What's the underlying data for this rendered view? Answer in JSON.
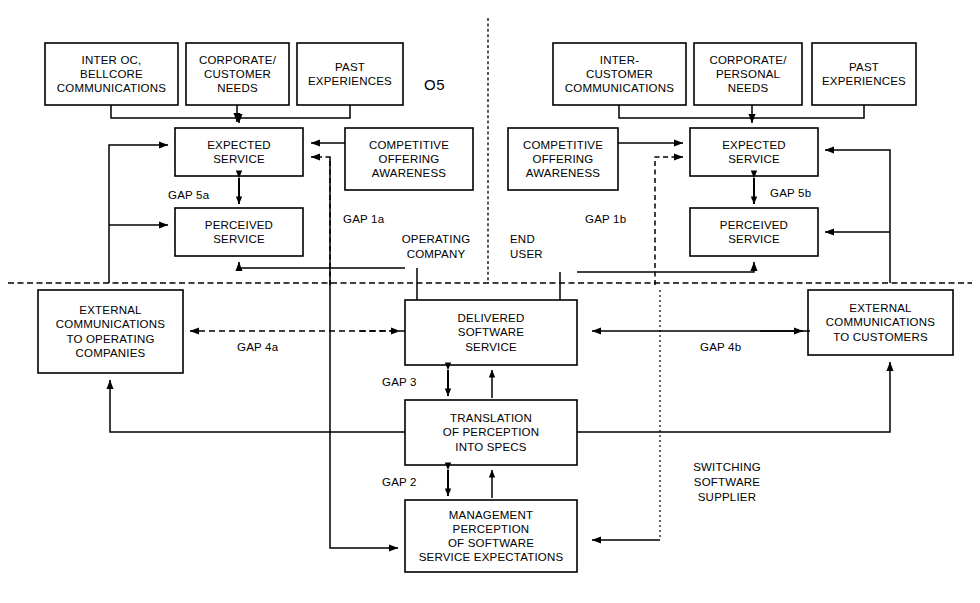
{
  "figure": {
    "number": "O5",
    "zones": {
      "left": "OPERATING\nCOMPANY",
      "right": "END\nUSER",
      "supplier": "SWITCHING\nSOFTWARE\nSUPPLIER"
    }
  },
  "boxes": {
    "inter_oc": "INTER OC,\nBELLCORE\nCOMMUNICATIONS",
    "corporate_customer_needs": "CORPORATE/\nCUSTOMER\nNEEDS",
    "past_experiences_left": "PAST\nEXPERIENCES",
    "expected_service_left": "EXPECTED\nSERVICE",
    "perceived_service_left": "PERCEIVED\nSERVICE",
    "competitive_offering_left": "COMPETITIVE\nOFFERING\nAWARENESS",
    "external_comms_oc": "EXTERNAL\nCOMMUNICATIONS\nTO OPERATING\nCOMPANIES",
    "inter_customer": "INTER-\nCUSTOMER\nCOMMUNICATIONS",
    "corporate_personal_needs": "CORPORATE/\nPERSONAL\nNEEDS",
    "past_experiences_right": "PAST\nEXPERIENCES",
    "expected_service_right": "EXPECTED\nSERVICE",
    "perceived_service_right": "PERCEIVED\nSERVICE",
    "competitive_offering_right": "COMPETITIVE\nOFFERING\nAWARENESS",
    "external_comms_customers": "EXTERNAL\nCOMMUNICATIONS\nTO CUSTOMERS",
    "delivered_software_service": "DELIVERED\nSOFTWARE\nSERVICE",
    "translation_of_perception": "TRANSLATION\nOF PERCEPTION\nINTO SPECS",
    "management_perception": "MANAGEMENT\nPERCEPTION\nOF SOFTWARE\nSERVICE EXPECTATIONS"
  },
  "gaps": {
    "gap5a": "GAP 5a",
    "gap1a": "GAP 1a",
    "gap4a": "GAP 4a",
    "gap5b": "GAP 5b",
    "gap1b": "GAP 1b",
    "gap4b": "GAP 4b",
    "gap3": "GAP 3",
    "gap2": "GAP 2"
  },
  "colors": {
    "stroke": "#000000",
    "background": "#ffffff"
  }
}
